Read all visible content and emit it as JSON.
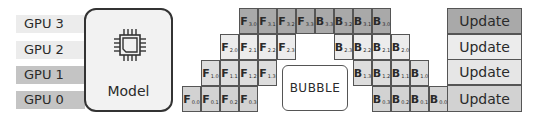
{
  "gpus": [
    {
      "label": "GPU 3",
      "top": 15,
      "color": "#ececec"
    },
    {
      "label": "GPU 2",
      "top": 41,
      "color": "#ececec"
    },
    {
      "label": "GPU 1",
      "top": 66,
      "color": "#c4c4c4"
    },
    {
      "label": "GPU 0",
      "top": 91,
      "color": "#c4c4c4"
    }
  ],
  "model": {
    "label": "Model",
    "icon": "chip-icon"
  },
  "bubble": {
    "label": "BUBBLE"
  },
  "grid": {
    "origin_x": 182,
    "cell_w": 19
  },
  "rows": [
    {
      "stage": 3,
      "top": 8,
      "color": "#a9a9a9",
      "f_start": 3,
      "b_start": 7,
      "f": [
        "3.0",
        "3.1",
        "3.2",
        "3.3"
      ],
      "b": [
        "3.3",
        "3.2",
        "3.1",
        "3.0"
      ]
    },
    {
      "stage": 2,
      "top": 34,
      "color": "#ececec",
      "f_start": 2,
      "b_start": 8,
      "f": [
        "2.0",
        "2.1",
        "2.2",
        "2.3"
      ],
      "b": [
        "2.3",
        "2.2",
        "2.1",
        "2.0"
      ]
    },
    {
      "stage": 1,
      "top": 60,
      "color": "#dddddd",
      "f_start": 1,
      "b_start": 9,
      "f": [
        "1.0",
        "1.1",
        "1.2",
        "1.3"
      ],
      "b": [
        "1.3",
        "1.2",
        "1.1",
        "1.0"
      ]
    },
    {
      "stage": 0,
      "top": 86,
      "color": "#d2d2d2",
      "f_start": 0,
      "b_start": 10,
      "f": [
        "0.0",
        "0.1",
        "0.2",
        "0.3"
      ],
      "b": [
        "0.3",
        "0.2",
        "0.1",
        "0.0"
      ]
    }
  ],
  "updates": [
    {
      "label": "Update",
      "top": 8,
      "height": 26,
      "color": "#a9a9a9"
    },
    {
      "label": "Update",
      "top": 34,
      "height": 26,
      "color": "#ececec"
    },
    {
      "label": "Update",
      "top": 59,
      "height": 26,
      "color": "#e6e6e6"
    },
    {
      "label": "Update",
      "top": 85,
      "height": 27,
      "color": "#d2d2d2"
    }
  ],
  "labels": {
    "forward_prefix": "F",
    "backward_prefix": "B"
  }
}
